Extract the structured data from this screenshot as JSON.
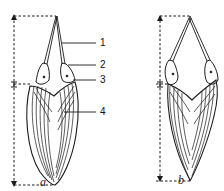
{
  "figure": {
    "panels": [
      {
        "id": "a",
        "caption": "a"
      },
      {
        "id": "b",
        "caption": "b"
      }
    ],
    "labels": [
      {
        "number": "1"
      },
      {
        "number": "2"
      },
      {
        "number": "3"
      },
      {
        "number": "4"
      }
    ],
    "colors": {
      "line": "#1a1a1a",
      "background": "#ffffff"
    }
  }
}
